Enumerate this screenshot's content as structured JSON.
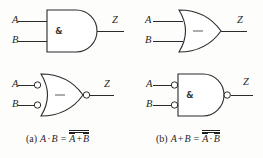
{
  "figure": {
    "background_color": "#fdfdfc",
    "line_color": "#2b2b2b"
  },
  "gates": [
    {
      "id": "and-gate",
      "position": "top-left",
      "shape": "and",
      "inner_symbol": "&",
      "inner_symbol_name": "ampersand-and-symbol",
      "inputs": [
        {
          "label": "A",
          "inverted": false
        },
        {
          "label": "B",
          "inverted": false
        }
      ],
      "output": {
        "label": "Z",
        "inverted": false
      }
    },
    {
      "id": "or-gate",
      "position": "top-right",
      "shape": "or",
      "inner_symbol": "—",
      "inner_symbol_name": "or-dash-symbol",
      "inputs": [
        {
          "label": "A",
          "inverted": false
        },
        {
          "label": "B",
          "inverted": false
        }
      ],
      "output": {
        "label": "Z",
        "inverted": false
      }
    },
    {
      "id": "or-gate-inverted-inputs",
      "position": "bottom-left",
      "shape": "or",
      "inner_symbol": "—",
      "inner_symbol_name": "or-dash-symbol",
      "inputs": [
        {
          "label": "A",
          "inverted": true
        },
        {
          "label": "B",
          "inverted": true
        }
      ],
      "output": {
        "label": "Z",
        "inverted": true
      }
    },
    {
      "id": "and-gate-inverted-inputs",
      "position": "bottom-right",
      "shape": "and",
      "inner_symbol": "&",
      "inner_symbol_name": "ampersand-and-symbol",
      "inputs": [
        {
          "label": "A",
          "inverted": true
        },
        {
          "label": "B",
          "inverted": true
        }
      ],
      "output": {
        "label": "Z",
        "inverted": true
      }
    }
  ],
  "captions": {
    "a": {
      "tag": "(a)",
      "lhs_var1": "A",
      "lhs_op": "·",
      "lhs_var2": "B",
      "equals": "=",
      "rhs_var1": "A",
      "rhs_op": "+",
      "rhs_var2": "B",
      "plain": "(a) A · B = A̅ + B̅ (overall bar)"
    },
    "b": {
      "tag": "(b)",
      "lhs_var1": "A",
      "lhs_op": "+",
      "lhs_var2": "B",
      "equals": "=",
      "rhs_var1": "A",
      "rhs_op": "·",
      "rhs_var2": "B",
      "plain": "(b) A + B = A̅ · B̅ (overall bar)"
    }
  }
}
